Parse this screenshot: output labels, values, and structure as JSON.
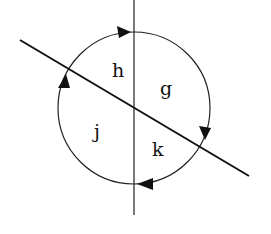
{
  "diagram": {
    "regions": [
      {
        "id": "h",
        "label": "h",
        "x": 112,
        "y": 77
      },
      {
        "id": "g",
        "label": "g",
        "x": 160,
        "y": 95
      },
      {
        "id": "j",
        "label": "j",
        "x": 94,
        "y": 138
      },
      {
        "id": "k",
        "label": "k",
        "x": 152,
        "y": 156
      }
    ],
    "circle": {
      "cx": 134,
      "cy": 108,
      "r": 76,
      "direction": "clockwise"
    },
    "lines": [
      {
        "name": "vertical-line",
        "x1": 134,
        "y1": 0,
        "x2": 134,
        "y2": 215
      },
      {
        "name": "diagonal-line",
        "x1": 20,
        "y1": 40,
        "x2": 249,
        "y2": 176
      }
    ],
    "arrows": [
      {
        "position": "top",
        "direction": "right"
      },
      {
        "position": "right",
        "direction": "down"
      },
      {
        "position": "bottom",
        "direction": "left"
      },
      {
        "position": "left",
        "direction": "up"
      }
    ],
    "colors": {
      "stroke": "#111111",
      "background": "#ffffff"
    }
  }
}
